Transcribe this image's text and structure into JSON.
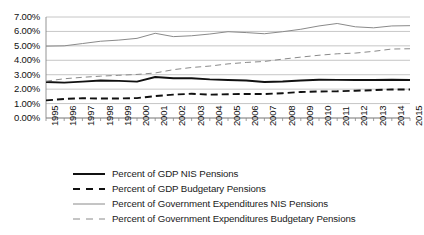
{
  "chart_data": {
    "type": "line",
    "title": "",
    "xlabel": "",
    "ylabel": "",
    "ylim": [
      0,
      7
    ],
    "ytick_labels": [
      "7.00%",
      "6.00%",
      "5.00%",
      "4.00%",
      "3.00%",
      "2.00%",
      "1.00%",
      "0.00%"
    ],
    "ytick_values": [
      7,
      6,
      5,
      4,
      3,
      2,
      1,
      0
    ],
    "grid": true,
    "legend_position": "bottom",
    "x": [
      1995,
      1996,
      1997,
      1998,
      1999,
      2000,
      2001,
      2002,
      2003,
      2004,
      2005,
      2006,
      2007,
      2008,
      2009,
      2010,
      2011,
      2012,
      2013,
      2014,
      2015
    ],
    "categories": [
      "1995",
      "1996",
      "1997",
      "1998",
      "1999",
      "2000",
      "2001",
      "2002",
      "2003",
      "2004",
      "2005",
      "2006",
      "2007",
      "2008",
      "2009",
      "2010",
      "2011",
      "2012",
      "2013",
      "2014",
      "2015"
    ],
    "series": [
      {
        "name": "Percent of GDP NIS Pensions",
        "style": "solid",
        "width": "thick",
        "color": "#111111",
        "values": [
          2.5,
          2.45,
          2.52,
          2.6,
          2.57,
          2.52,
          2.84,
          2.76,
          2.76,
          2.68,
          2.63,
          2.6,
          2.5,
          2.53,
          2.6,
          2.65,
          2.64,
          2.63,
          2.63,
          2.65,
          2.63
        ]
      },
      {
        "name": "Percent of GDP Budgetary Pensions",
        "style": "dashed",
        "width": "thick",
        "color": "#111111",
        "values": [
          1.22,
          1.32,
          1.37,
          1.35,
          1.35,
          1.38,
          1.52,
          1.62,
          1.68,
          1.62,
          1.65,
          1.67,
          1.66,
          1.72,
          1.8,
          1.84,
          1.85,
          1.89,
          1.93,
          1.98,
          1.98
        ]
      },
      {
        "name": "Percent of Government Expenditures NIS Pensions",
        "style": "solid",
        "width": "thin",
        "color": "#8a8a8a",
        "values": [
          4.98,
          5.0,
          5.16,
          5.32,
          5.4,
          5.52,
          5.87,
          5.64,
          5.7,
          5.82,
          5.98,
          5.92,
          5.84,
          5.98,
          6.15,
          6.38,
          6.55,
          6.32,
          6.25,
          6.38,
          6.4
        ]
      },
      {
        "name": "Percent of Government Expenditures Budgetary Pensions",
        "style": "dashed",
        "width": "thin",
        "color": "#8a8a8a",
        "values": [
          2.55,
          2.72,
          2.82,
          2.9,
          2.96,
          3.02,
          3.12,
          3.35,
          3.5,
          3.6,
          3.75,
          3.85,
          3.92,
          4.08,
          4.22,
          4.35,
          4.45,
          4.5,
          4.62,
          4.78,
          4.8
        ]
      }
    ]
  },
  "legend": {
    "items": [
      {
        "label": "Percent of GDP NIS Pensions"
      },
      {
        "label": "Percent of GDP Budgetary Pensions"
      },
      {
        "label": "Percent of Government Expenditures NIS Pensions"
      },
      {
        "label": "Percent of Government Expenditures Budgetary Pensions"
      }
    ]
  }
}
